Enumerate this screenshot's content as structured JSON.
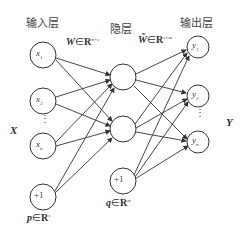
{
  "layers": {
    "input": {
      "title": "输入层",
      "nodes": [
        "x1",
        "x2",
        "xn",
        "+1"
      ]
    },
    "hidden": {
      "title": "隐层",
      "nodes": [
        "",
        "",
        "+1"
      ]
    },
    "output": {
      "title": "输出层",
      "nodes": [
        "y1",
        "y2",
        "yn"
      ]
    }
  },
  "weights": {
    "W": {
      "symbol": "W",
      "in": "∈",
      "set": "R",
      "dim": "n×s"
    },
    "W_tilde": {
      "symbol": "W̃",
      "in": "∈",
      "set": "R",
      "dim": "s×m"
    }
  },
  "biases": {
    "p": {
      "symbol": "p",
      "in": "∈",
      "set": "R",
      "dim": "s"
    },
    "q": {
      "symbol": "q",
      "in": "∈",
      "set": "R",
      "dim": "m"
    }
  },
  "side_labels": {
    "input": "X",
    "output": "Y"
  },
  "ellipsis": "⋮",
  "colors": {
    "stroke": "#333333",
    "text": "#444444"
  }
}
